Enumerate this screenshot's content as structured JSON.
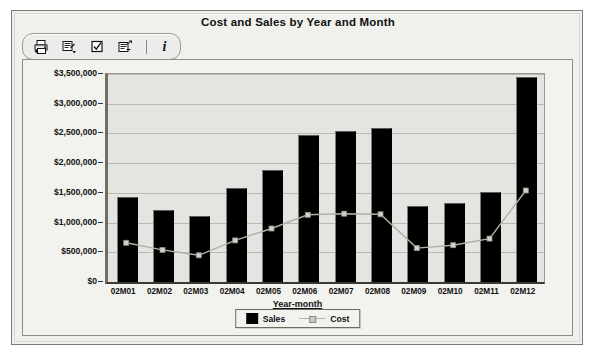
{
  "window": {
    "title": "Cost and Sales by Year and Month"
  },
  "toolbar": {
    "buttons": [
      {
        "name": "print-icon",
        "label": "Print"
      },
      {
        "name": "export-icon",
        "label": "Export"
      },
      {
        "name": "checkbox-icon",
        "label": "Select"
      },
      {
        "name": "properties-icon",
        "label": "Properties"
      }
    ],
    "separator": "|",
    "info_label": "i"
  },
  "chart_data": {
    "type": "bar",
    "title": "Cost and Sales by Year and Month",
    "xlabel": "Year-month",
    "ylabel": "",
    "ylim": [
      0,
      3500000
    ],
    "ytick_labels": [
      "$3,500,000",
      "$3,000,000",
      "$2,500,000",
      "$2,000,000",
      "$1,500,000",
      "$1,000,000",
      "$500,000",
      "$0"
    ],
    "ytick_values": [
      3500000,
      3000000,
      2500000,
      2000000,
      1500000,
      1000000,
      500000,
      0
    ],
    "grid": true,
    "legend_position": "bottom",
    "categories": [
      "02M01",
      "02M02",
      "02M03",
      "02M04",
      "02M05",
      "02M06",
      "02M07",
      "02M08",
      "02M09",
      "02M10",
      "02M11",
      "02M12"
    ],
    "series": [
      {
        "name": "Sales",
        "render": "bar",
        "color": "#000000",
        "values": [
          1410000,
          1200000,
          1090000,
          1570000,
          1870000,
          2460000,
          2520000,
          2570000,
          1260000,
          1320000,
          1500000,
          3440000
        ]
      },
      {
        "name": "Cost",
        "render": "line",
        "color": "#b0b0a8",
        "values": [
          660000,
          540000,
          450000,
          700000,
          900000,
          1130000,
          1150000,
          1140000,
          570000,
          620000,
          730000,
          1540000
        ]
      }
    ]
  }
}
